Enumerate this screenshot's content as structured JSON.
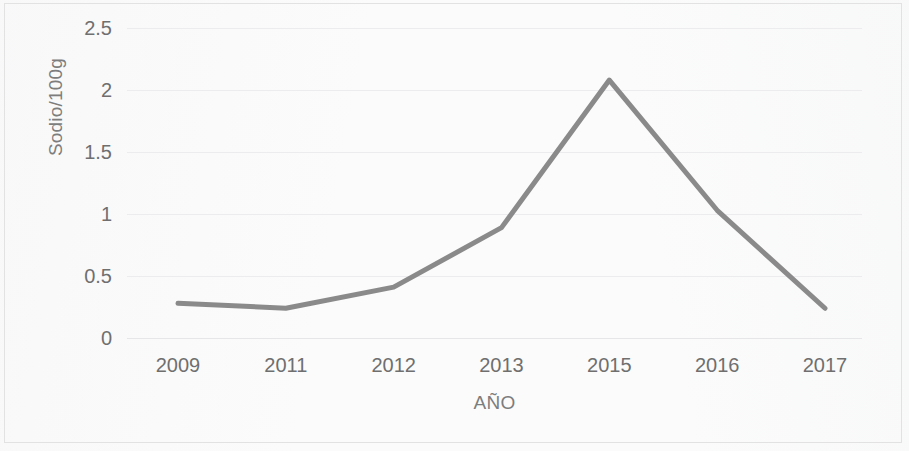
{
  "chart_data": {
    "type": "line",
    "title": "",
    "subtitle": "",
    "xlabel": "AÑO",
    "ylabel": "Sodio/100g",
    "categories": [
      "2009",
      "2011",
      "2012",
      "2013",
      "2015",
      "2016",
      "2017"
    ],
    "values": [
      0.28,
      0.24,
      0.41,
      0.89,
      2.08,
      1.03,
      0.24
    ],
    "series": [
      {
        "name": "Sodio/100g",
        "values": [
          0.28,
          0.24,
          0.41,
          0.89,
          2.08,
          1.03,
          0.24
        ]
      }
    ],
    "ylim": [
      0,
      2.5
    ],
    "yticks": [
      0,
      0.5,
      1,
      1.5,
      2,
      2.5
    ],
    "ytick_labels": [
      "0",
      "0.5",
      "1",
      "1.5",
      "2",
      "2.5"
    ],
    "xtick_labels": [
      "2009",
      "2011",
      "2012",
      "2013",
      "2015",
      "2016",
      "2017"
    ],
    "grid": "horizontal",
    "legend": "none",
    "annotations": [],
    "line_color": "#8a8a8a",
    "grid_color": "#ececee",
    "text_color": "#6f6f6f",
    "background_color": "#fbfbfb",
    "border_color": "#e2e2e2"
  }
}
